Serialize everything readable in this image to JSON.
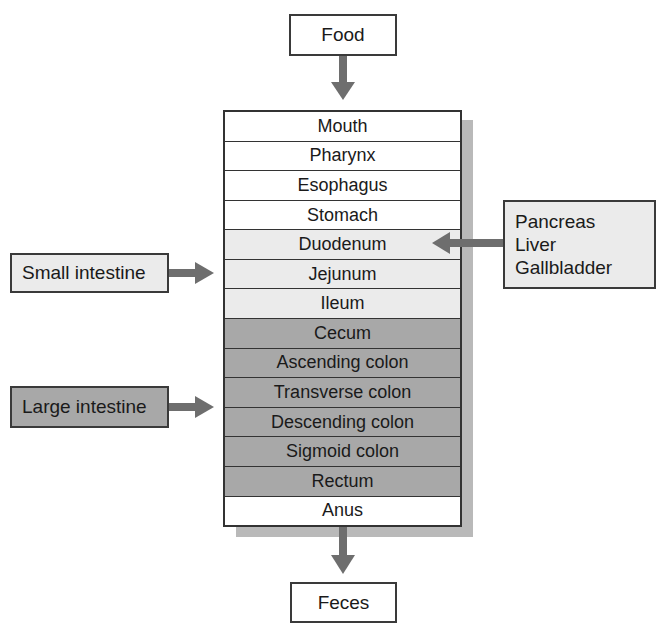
{
  "diagram": {
    "input": "Food",
    "output": "Feces",
    "tract": [
      {
        "label": "Mouth",
        "group": "upper"
      },
      {
        "label": "Pharynx",
        "group": "upper"
      },
      {
        "label": "Esophagus",
        "group": "upper"
      },
      {
        "label": "Stomach",
        "group": "upper"
      },
      {
        "label": "Duodenum",
        "group": "small"
      },
      {
        "label": "Jejunum",
        "group": "small"
      },
      {
        "label": "Ileum",
        "group": "small"
      },
      {
        "label": "Cecum",
        "group": "large"
      },
      {
        "label": "Ascending colon",
        "group": "large"
      },
      {
        "label": "Transverse colon",
        "group": "large"
      },
      {
        "label": "Descending colon",
        "group": "large"
      },
      {
        "label": "Sigmoid colon",
        "group": "large"
      },
      {
        "label": "Rectum",
        "group": "large"
      },
      {
        "label": "Anus",
        "group": "upper"
      }
    ],
    "labels": {
      "small_intestine": "Small intestine",
      "large_intestine": "Large intestine"
    },
    "accessory_organs": [
      "Pancreas",
      "Liver",
      "Gallbladder"
    ],
    "colors": {
      "white": "#ffffff",
      "small_intestine": "#ebebeb",
      "large_intestine": "#a8a8a8",
      "arrow": "#6e6e6e",
      "border": "#333333",
      "shadow": "#b9b9b9"
    }
  }
}
